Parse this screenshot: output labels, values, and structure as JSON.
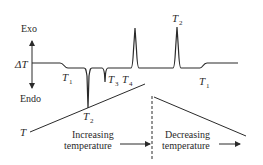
{
  "diagram": {
    "type": "DTA thermogram",
    "axis_labels": {
      "top": "Exo",
      "middle": "ΔT",
      "bottom": "Endo",
      "temperature": "T"
    },
    "transitions_heating": [
      {
        "label": "T",
        "sub": "1",
        "kind": "baseline shift (glass transition)"
      },
      {
        "label": "T",
        "sub": "2",
        "kind": "endothermic dip"
      },
      {
        "label": "T",
        "sub": "3",
        "kind": "small endothermic dip"
      },
      {
        "label": "T",
        "sub": "4",
        "kind": "exothermic peak"
      }
    ],
    "transitions_cooling": [
      {
        "label": "T",
        "sub": "2",
        "kind": "exothermic peak"
      },
      {
        "label": "T",
        "sub": "1",
        "kind": "baseline shift"
      }
    ],
    "phases": {
      "increasing_line1": "Increasing",
      "increasing_line2": "temperature",
      "decreasing_line1": "Decreasing",
      "decreasing_line2": "temperature"
    },
    "colors": {
      "line": "#2a2a2a",
      "background": "#ffffff"
    }
  }
}
